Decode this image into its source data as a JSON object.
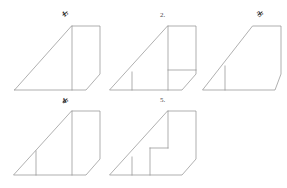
{
  "page": {
    "background_color": "#ffffff",
    "stroke_color": "#8e8e8e",
    "label_color": "#4a4a4a",
    "width": 287,
    "height": 188
  },
  "figures": [
    {
      "id": "figure-1",
      "label": "1.",
      "label_style": "struck",
      "label_x": 62,
      "label_y": 9,
      "description": "right triangle joined to an upright quadrilateral with slanted right edge",
      "outline": "M 14 90 L 14 90 L 86 90 L 100 74 L 100 26 L 72 26 Z",
      "interior_lines": [
        "M 72 26 L 72 90"
      ]
    },
    {
      "id": "figure-2",
      "label": "2.",
      "label_style": "plain",
      "label_x": 160,
      "label_y": 11,
      "description": "same outline with an inner vertical segment at left and an inner horizontal segment across the upright panel",
      "outline": "M 110 90 L 182 90 L 196 74 L 196 26 L 168 26 Z",
      "interior_lines": [
        "M 168 26 L 168 90",
        "M 168 70 L 196 70",
        "M 132 72 L 132 90"
      ]
    },
    {
      "id": "figure-3",
      "label": "3.",
      "label_style": "struck",
      "label_x": 257,
      "label_y": 9,
      "description": "trapezoid with clipped upper-left slope and a short inner vertical segment at left",
      "outline": "M 203 90 L 275 90 L 281 74 L 281 26 L 253 26 Z",
      "interior_lines": [
        "M 225 66 L 225 90"
      ]
    },
    {
      "id": "figure-4",
      "label": "4.",
      "label_style": "struck",
      "label_x": 62,
      "label_y": 96,
      "description": "repeat of figure 1 with an added short inner vertical segment at left",
      "outline": "M 14 175 L 86 175 L 100 159 L 100 111 L 72 111 Z",
      "interior_lines": [
        "M 72 111 L 72 175",
        "M 36 151 L 36 175"
      ]
    },
    {
      "id": "figure-5",
      "label": "5.",
      "label_style": "plain",
      "label_x": 160,
      "label_y": 96,
      "description": "outline with a rectangular notch removed from the lower middle and inner vertical segment at left",
      "outline": "M 110 175 L 182 175 L 196 159 L 196 111 L 168 111 Z",
      "interior_lines": [
        "M 168 111 L 168 148",
        "M 168 148 L 150 148",
        "M 150 148 L 150 175",
        "M 132 157 L 132 175"
      ]
    }
  ]
}
